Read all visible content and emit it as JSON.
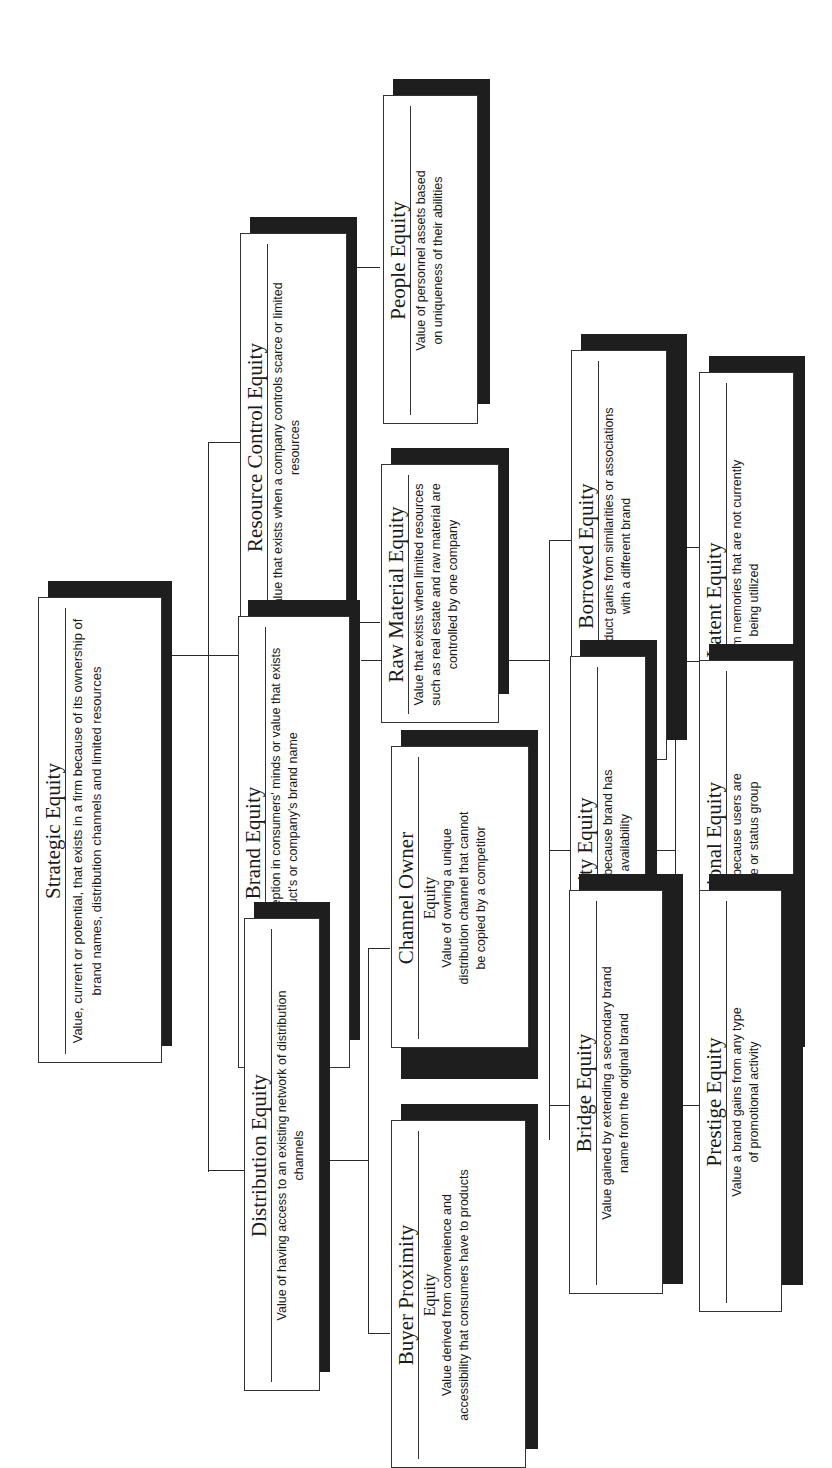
{
  "diagram": {
    "orientation": "rotated-90-ccw",
    "root": {
      "title": "Strategic Equity",
      "description": "Value, current or potential, that exists in a firm because of its ownership of brand names, distribution channels and limited resources"
    },
    "level1": [
      {
        "title": "Resource Control Equity",
        "description": "Value that exists when a company controls scarce or limited resources"
      },
      {
        "title": "Brand Equity",
        "description": "Value derived from perception in consumers' minds or value that exists in a product's or company's brand name"
      },
      {
        "title": "Distribution Equity",
        "description": "Value of having access to an existing network of distribution channels"
      }
    ],
    "resource_children": [
      {
        "title": "People Equity",
        "description": "Value of personnel assets based on uniqueness of their abilities"
      },
      {
        "title": "Raw Material Equity",
        "description": "Value that exists when limited resources such as real estate and raw material are controlled by one company"
      }
    ],
    "distribution_children": [
      {
        "title": "Channel Owner",
        "subtitle": "Equity",
        "description": "Value of owning a unique distribution channel that cannot be copied by a competitor"
      },
      {
        "title": "Buyer Proximity",
        "subtitle": "Equity",
        "description": "Value derived from convenience and accessibility that consumers have to products"
      }
    ],
    "brand_children_row1": [
      {
        "title": "Borrowed Equity",
        "description": "Value a product gains from similarities or associations with a different brand"
      },
      {
        "title": "Scarcity Equity",
        "description": "Value created because brand has limited availability"
      },
      {
        "title": "Bridge Equity",
        "description": "Value gained by extending a secondary brand name from the original brand"
      }
    ],
    "brand_children_row2": [
      {
        "title": "Latent Equity",
        "description": "Value derived from memories that are not currently being utilized"
      },
      {
        "title": "Promotional Equity",
        "description": "Value created because users are part of an elite or status group"
      },
      {
        "title": "Prestige Equity",
        "description": "Value a brand gains from any type of promotional activity"
      }
    ]
  }
}
